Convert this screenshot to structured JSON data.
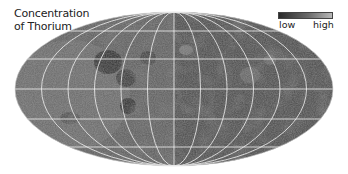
{
  "title": {
    "line1": "Concentration",
    "line2": "of Thorium"
  },
  "legend": {
    "low_label": "low",
    "high_label": "high",
    "gradient_colors": [
      "#2a2a2a",
      "#6a6a6a",
      "#b8b8b8"
    ]
  },
  "map": {
    "projection": "Mollweide (equal-area, elliptical)",
    "subject": "Lunar surface thorium abundance",
    "grid": {
      "meridian_spacing_deg": 30,
      "parallel_count": 5,
      "line_color": "#f2f2f2"
    },
    "colors": {
      "base": "#5a5a5a",
      "dark": "#2e2e2e",
      "light": "#9a9a9a"
    }
  }
}
